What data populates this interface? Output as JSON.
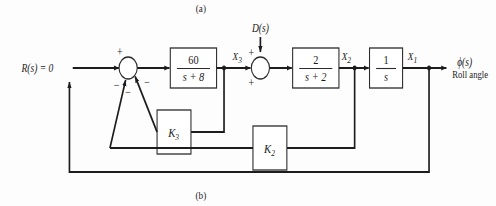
{
  "figure": {
    "caption_top": "(a)",
    "caption_bottom": "(b)"
  },
  "signals": {
    "reference_input": "R(s) = 0",
    "disturbance": "D(s)",
    "x3": "X",
    "x3_sub": "3",
    "x2": "X",
    "x2_sub": "2",
    "x1": "X",
    "x1_sub": "1",
    "output": "ϕ(s)",
    "output_description": "Roll angle"
  },
  "blocks": {
    "plant1": {
      "name": "actuator-block",
      "numerator": "60",
      "denominator": "s + 8"
    },
    "plant2": {
      "name": "roll-rate-block",
      "numerator": "2",
      "denominator": "s + 2"
    },
    "integrator": {
      "name": "integrator-block",
      "numerator": "1",
      "denominator": "s"
    },
    "gain_k3": {
      "label": "K",
      "subscript": "3"
    },
    "gain_k2": {
      "label": "K",
      "subscript": "2"
    }
  },
  "summing_junctions": {
    "error_junction": {
      "sign_reference": "+",
      "sign_outer_feedback": "−",
      "sign_k2_feedback": "−",
      "sign_k3_feedback": "−"
    },
    "disturbance_junction": {
      "sign_disturbance": "+",
      "sign_forward": "+"
    }
  },
  "colors": {
    "line": "#1c1c1c",
    "block_stroke": "#2b2b2b",
    "background": "#fdfdfd",
    "text": "#1a1a1a"
  }
}
